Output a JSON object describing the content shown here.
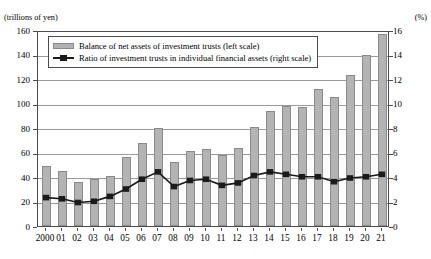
{
  "chart_data": {
    "type": "bar",
    "title": "",
    "xlabel": "",
    "ylabel": "(trillions of yen)",
    "y2label": "(%)",
    "grid": true,
    "legend_position": "top-left inside plot",
    "categories": [
      "2000",
      "01",
      "02",
      "03",
      "04",
      "05",
      "06",
      "07",
      "08",
      "09",
      "10",
      "11",
      "12",
      "13",
      "14",
      "15",
      "16",
      "17",
      "18",
      "19",
      "20",
      "21"
    ],
    "x_full_years": [
      2000,
      2001,
      2002,
      2003,
      2004,
      2005,
      2006,
      2007,
      2008,
      2009,
      2010,
      2011,
      2012,
      2013,
      2014,
      2015,
      2016,
      2017,
      2018,
      2019,
      2020,
      2021
    ],
    "ylim": [
      0,
      160
    ],
    "yticks": [
      0,
      20,
      40,
      60,
      80,
      100,
      120,
      140,
      160
    ],
    "y2lim": [
      0,
      16
    ],
    "y2ticks": [
      0,
      2,
      4,
      6,
      8,
      10,
      12,
      14,
      16
    ],
    "series": [
      {
        "name": "Balance of net assets of investment trusts (left scale)",
        "kind": "bar",
        "axis": "left",
        "unit": "trillions of yen",
        "color": "#b3b3b3",
        "values": [
          49,
          45,
          36,
          38,
          41,
          56,
          68,
          80,
          52,
          61,
          63,
          58,
          64,
          81,
          94,
          98,
          97,
          112,
          105,
          123,
          140,
          157
        ]
      },
      {
        "name": "Ratio of investment trusts in individual financial assets (right scale)",
        "kind": "line",
        "axis": "right",
        "unit": "%",
        "color": "#1a1a1a",
        "values": [
          2.4,
          2.3,
          2.0,
          2.1,
          2.5,
          3.1,
          3.9,
          4.5,
          3.3,
          3.8,
          3.9,
          3.4,
          3.6,
          4.2,
          4.5,
          4.3,
          4.1,
          4.1,
          3.7,
          4.0,
          4.1,
          4.3
        ]
      }
    ]
  },
  "axes": {
    "unit_left": "(trillions of yen)",
    "unit_right": "(%)"
  },
  "legend": {
    "items": [
      {
        "label": "Balance of net assets of investment trusts (left scale)",
        "marker": "bar-swatch"
      },
      {
        "label": "Ratio of investment trusts in individual financial assets (right scale)",
        "marker": "line-square-marker"
      }
    ]
  }
}
